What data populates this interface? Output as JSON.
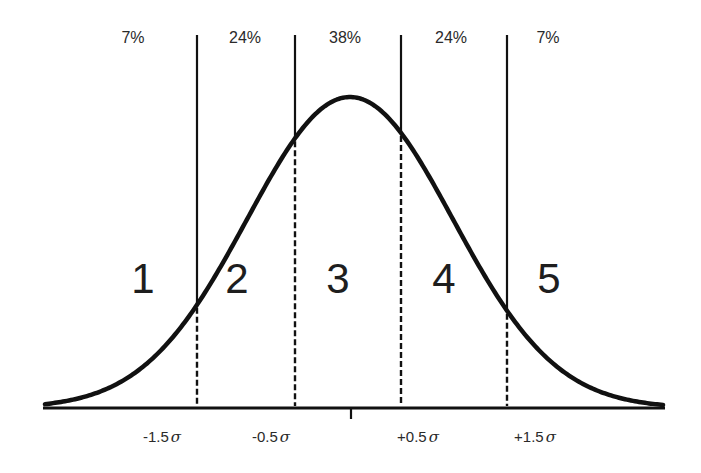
{
  "chart_data": {
    "type": "line",
    "title": "",
    "xlabel": "",
    "ylabel": "",
    "grid": false,
    "legend": null,
    "boundaries_sigma": [
      -1.5,
      -0.5,
      0.5,
      1.5
    ],
    "boundary_labels": [
      "-1.5σ",
      "-0.5σ",
      "+0.5σ",
      "+1.5σ"
    ],
    "regions": [
      {
        "number": "1",
        "percent": "7%",
        "range": "< -1.5σ"
      },
      {
        "number": "2",
        "percent": "24%",
        "range": "-1.5σ to -0.5σ"
      },
      {
        "number": "3",
        "percent": "38%",
        "range": "-0.5σ to +0.5σ"
      },
      {
        "number": "4",
        "percent": "24%",
        "range": "+0.5σ to +1.5σ"
      },
      {
        "number": "5",
        "percent": "7%",
        "range": "> +1.5σ"
      }
    ],
    "x_range_sigma": [
      -3,
      3
    ],
    "center_tick": 0
  },
  "geometry": {
    "center_x": 350,
    "sigma_px": 103,
    "baseline_y": 408,
    "peak_y": 97,
    "axis_x_start": 43,
    "axis_x_end": 665,
    "line_top_y": 35,
    "boundary_x": [
      197,
      295,
      401,
      507
    ],
    "center_tick_bottom": 419
  },
  "colors": {
    "stroke": "#111111",
    "background": "#ffffff",
    "text": "#2a2a2a"
  },
  "percent_labels": [
    {
      "text": "7%",
      "x": 133
    },
    {
      "text": "24%",
      "x": 245
    },
    {
      "text": "38%",
      "x": 345
    },
    {
      "text": "24%",
      "x": 451
    },
    {
      "text": "7%",
      "x": 548
    }
  ],
  "region_labels": [
    {
      "text": "1",
      "x": 143
    },
    {
      "text": "2",
      "x": 237
    },
    {
      "text": "3",
      "x": 338
    },
    {
      "text": "4",
      "x": 444
    },
    {
      "text": "5",
      "x": 549
    }
  ],
  "sigma_labels": [
    {
      "value": "-1.5",
      "symbol": "σ",
      "x": 162
    },
    {
      "value": "-0.5",
      "symbol": "σ",
      "x": 271
    },
    {
      "value": "+0.5",
      "symbol": "σ",
      "x": 418
    },
    {
      "value": "+1.5",
      "symbol": "σ",
      "x": 535
    }
  ]
}
